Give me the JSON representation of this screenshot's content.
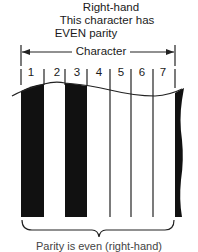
{
  "header": {
    "line1": "Right-hand",
    "line2": "This character has",
    "line3": "EVEN parity"
  },
  "span_label": "Character",
  "modules": [
    "1",
    "2",
    "3",
    "4",
    "5",
    "6",
    "7"
  ],
  "module_pattern": [
    "black",
    "white",
    "black",
    "white",
    "white",
    "white",
    "white"
  ],
  "colors": {
    "bar": "#111111",
    "line": "#222222",
    "background": "#ffffff"
  },
  "footer_truncated_text": "Parity is even (right-hand)"
}
